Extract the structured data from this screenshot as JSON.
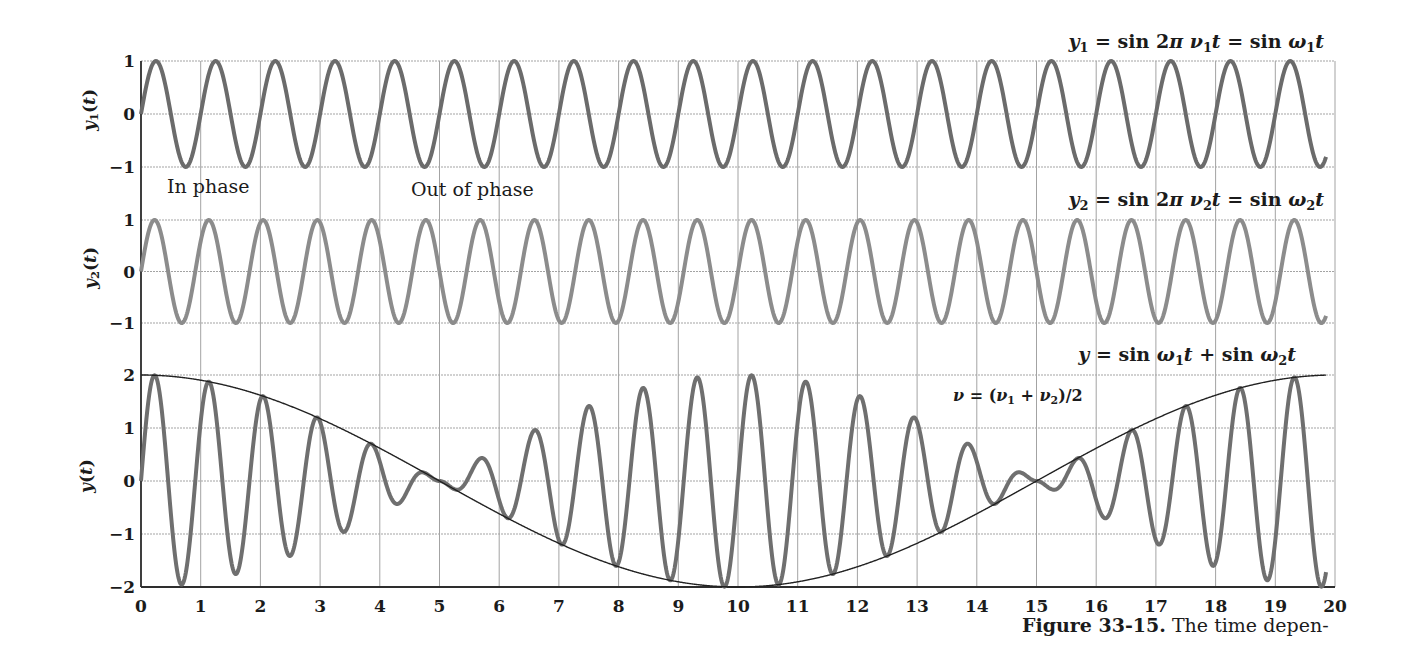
{
  "figure": {
    "caption": {
      "label": "Figure 33-15.",
      "text": " The time depen-"
    },
    "annotations": {
      "in_phase": "In phase",
      "out_of_phase": "Out of phase",
      "y1_equation": {
        "text": "y₁ = sin 2π ν₁t = sin ω₁t",
        "segments": [
          [
            "y",
            "i"
          ],
          [
            "1",
            "sub"
          ],
          [
            " = sin 2",
            ""
          ],
          [
            "π",
            "i"
          ],
          [
            " ",
            ""
          ],
          [
            "ν",
            "i"
          ],
          [
            "1",
            "sub"
          ],
          [
            "t",
            "i"
          ],
          [
            " = sin ",
            ""
          ],
          [
            "ω",
            "i"
          ],
          [
            "1",
            "sub"
          ],
          [
            "t",
            "i"
          ]
        ]
      },
      "y2_equation": {
        "text": "y₂ = sin 2π ν₂t = sin ω₂t",
        "segments": [
          [
            "y",
            "i"
          ],
          [
            "2",
            "sub"
          ],
          [
            " = sin 2",
            ""
          ],
          [
            "π",
            "i"
          ],
          [
            " ",
            ""
          ],
          [
            "ν",
            "i"
          ],
          [
            "2",
            "sub"
          ],
          [
            "t",
            "i"
          ],
          [
            " = sin ",
            ""
          ],
          [
            "ω",
            "i"
          ],
          [
            "2",
            "sub"
          ],
          [
            "t",
            "i"
          ]
        ]
      },
      "sum_equation": {
        "text": "y = sin ω₁t + sin ω₂t",
        "segments": [
          [
            "y",
            "i"
          ],
          [
            " = sin ",
            ""
          ],
          [
            "ω",
            "i"
          ],
          [
            "1",
            "sub"
          ],
          [
            "t",
            "i"
          ],
          [
            " + sin ",
            ""
          ],
          [
            "ω",
            "i"
          ],
          [
            "2",
            "sub"
          ],
          [
            "t",
            "i"
          ]
        ]
      },
      "mean_frequency": {
        "text": "ν = (ν₁ + ν₂)/2",
        "segments": [
          [
            "ν",
            "i"
          ],
          [
            " = (",
            ""
          ],
          [
            "ν",
            "i"
          ],
          [
            "1",
            "sub"
          ],
          [
            " + ",
            ""
          ],
          [
            "ν",
            "i"
          ],
          [
            "2",
            "sub"
          ],
          [
            ")/2",
            ""
          ]
        ]
      }
    },
    "axis_titles": {
      "y1": {
        "text": "y₁(t)",
        "segments": [
          [
            "y",
            "i"
          ],
          [
            "1",
            "sub"
          ],
          [
            "(",
            ""
          ],
          [
            "t",
            "i"
          ],
          [
            ")",
            ""
          ]
        ]
      },
      "y2": {
        "text": "y₂(t)",
        "segments": [
          [
            "y",
            "i"
          ],
          [
            "2",
            "sub"
          ],
          [
            "(",
            ""
          ],
          [
            "t",
            "i"
          ],
          [
            ")",
            ""
          ]
        ]
      },
      "y": {
        "text": "y(t)",
        "segments": [
          [
            "y",
            "i"
          ],
          [
            "(",
            ""
          ],
          [
            "t",
            "i"
          ],
          [
            ")",
            ""
          ]
        ]
      }
    }
  },
  "chart_data": {
    "type": "line",
    "title": "",
    "xlabel": "",
    "x_range": [
      0,
      20
    ],
    "xticks": [
      0,
      1,
      2,
      3,
      4,
      5,
      6,
      7,
      8,
      9,
      10,
      11,
      12,
      13,
      14,
      15,
      16,
      17,
      18,
      19,
      20
    ],
    "xtick_labels": [
      "0",
      "1",
      "2",
      "3",
      "4",
      "5",
      "6",
      "7",
      "8",
      "9",
      "10",
      "11",
      "12",
      "13",
      "14",
      "15",
      "16",
      "17",
      "18",
      "19",
      "20"
    ],
    "grid": true,
    "legend": null,
    "panels": [
      {
        "id": "y1",
        "ylabel": "y1(t)",
        "ylim": [
          -1,
          1
        ],
        "yticks": [
          1,
          0,
          -1
        ],
        "ytick_labels": [
          "1",
          "0",
          "−1"
        ]
      },
      {
        "id": "y2",
        "ylabel": "y2(t)",
        "ylim": [
          -1,
          1
        ],
        "yticks": [
          1,
          0,
          -1
        ],
        "ytick_labels": [
          "1",
          "0",
          "−1"
        ]
      },
      {
        "id": "y",
        "ylabel": "y(t)",
        "ylim": [
          -2,
          2
        ],
        "yticks": [
          2,
          1,
          0,
          -1,
          -2
        ],
        "ytick_labels": [
          "2",
          "1",
          "0",
          "−1",
          "−2"
        ]
      }
    ],
    "series": [
      {
        "name": "y1",
        "panel": 0,
        "kind": "sine",
        "label": "y1 = sin 2π ν1 t = sin ω1 t",
        "params": {
          "amplitude": 1,
          "frequency": 1.0
        },
        "color": "#6b6b6b",
        "width": 4,
        "x": [
          0,
          1,
          2,
          3,
          4,
          5,
          6,
          7,
          8,
          9,
          10,
          11,
          12,
          13,
          14,
          15,
          16,
          17,
          18,
          19,
          20
        ],
        "values": [
          0,
          0,
          0,
          0,
          0,
          0,
          0,
          0,
          0,
          0,
          0,
          0,
          0,
          0,
          0,
          0,
          0,
          0,
          0,
          0,
          0
        ]
      },
      {
        "name": "y2",
        "panel": 1,
        "kind": "sine",
        "label": "y2 = sin 2π ν2 t = sin ω2 t",
        "params": {
          "amplitude": 1,
          "frequency": 1.1
        },
        "color": "#8c8c8c",
        "width": 4,
        "x": [
          0,
          1,
          2,
          3,
          4,
          5,
          6,
          7,
          8,
          9,
          10,
          11,
          12,
          13,
          14,
          15,
          16,
          17,
          18,
          19,
          20
        ],
        "values": [
          0,
          0.588,
          0.951,
          0.951,
          0.588,
          0,
          -0.588,
          -0.951,
          -0.951,
          -0.588,
          0,
          0.588,
          0.951,
          0.951,
          0.588,
          0,
          -0.588,
          -0.951,
          -0.951,
          -0.588,
          0
        ]
      },
      {
        "name": "y",
        "panel": 2,
        "kind": "beat",
        "label": "y = sin ω1 t + sin ω2 t",
        "params": {
          "max_amplitude": 2,
          "carrier_frequency": 1.1,
          "beat_frequency_difference": 0.1
        },
        "color": "#6f6f6f",
        "width": 4,
        "x": [
          0,
          1,
          2,
          3,
          4,
          5,
          6,
          7,
          8,
          9,
          10,
          11,
          12,
          13,
          14,
          15,
          16,
          17,
          18,
          19,
          20
        ],
        "values": [
          0,
          1.118,
          1.539,
          1.118,
          0.363,
          0,
          -0.363,
          -1.118,
          -1.539,
          -1.118,
          0,
          1.118,
          1.539,
          1.118,
          0.363,
          0,
          -0.363,
          -1.118,
          -1.539,
          -1.118,
          0
        ]
      },
      {
        "name": "envelope",
        "panel": 2,
        "kind": "envelope",
        "label": "ν = (ν1 + ν2)/2",
        "params": {
          "max_amplitude": 2,
          "beat_frequency_difference": 0.1
        },
        "color": "#222222",
        "width": 1.4,
        "x": [
          0,
          1,
          2,
          3,
          4,
          5,
          6,
          7,
          8,
          9,
          10,
          11,
          12,
          13,
          14,
          15,
          16,
          17,
          18,
          19,
          20
        ],
        "values": [
          2,
          1.902,
          1.618,
          1.176,
          0.618,
          0,
          -0.618,
          -1.176,
          -1.618,
          -1.902,
          -2,
          -1.902,
          -1.618,
          -1.176,
          -0.618,
          0,
          0.618,
          1.176,
          1.618,
          1.902,
          2
        ]
      }
    ],
    "colors": {
      "grid": "#a3a3a3",
      "axis": "#2e2e2e"
    }
  }
}
